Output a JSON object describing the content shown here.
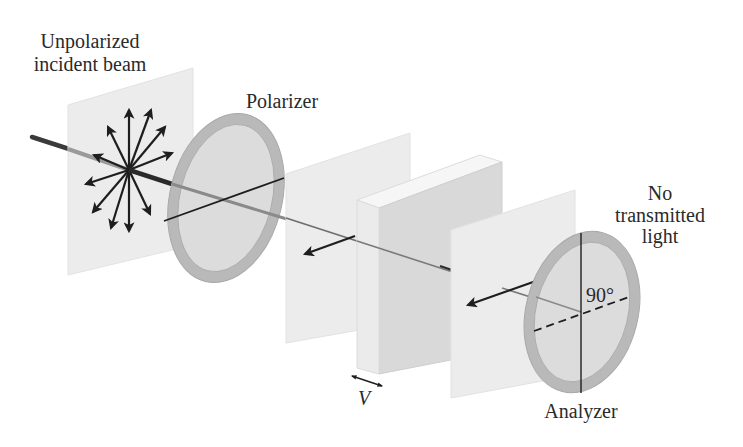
{
  "labels": {
    "incident_line1": "Unpolarized",
    "incident_line2": "incident beam",
    "polarizer": "Polarizer",
    "no_light_line1": "No",
    "no_light_line2": "transmitted",
    "no_light_line3": "light",
    "angle": "90°",
    "voltage": "V",
    "analyzer": "Analyzer"
  },
  "colors": {
    "background": "#ffffff",
    "panel": "#ececec",
    "panel_edge": "#e2e2e2",
    "ring": "#b9b9b9",
    "ring_inner": "#dcdcdc",
    "slab_front": "#d9d9d9",
    "slab_side": "#ebebeb",
    "slab_top": "#f6f6f6",
    "beam": "#6e6e6e",
    "arrow": "#1e1e1e",
    "text": "#2a2a2a"
  },
  "components": [
    {
      "id": "incident-panel",
      "type": "wave-plane"
    },
    {
      "id": "polarizer",
      "type": "polarizing-filter",
      "axis": "tilted"
    },
    {
      "id": "middle-panel",
      "type": "wave-plane"
    },
    {
      "id": "electro-optic-cell",
      "type": "crystal-slab",
      "control": "V"
    },
    {
      "id": "output-panel",
      "type": "wave-plane"
    },
    {
      "id": "analyzer",
      "type": "polarizing-filter",
      "axis": "vertical",
      "crossed_angle": "90°"
    }
  ]
}
